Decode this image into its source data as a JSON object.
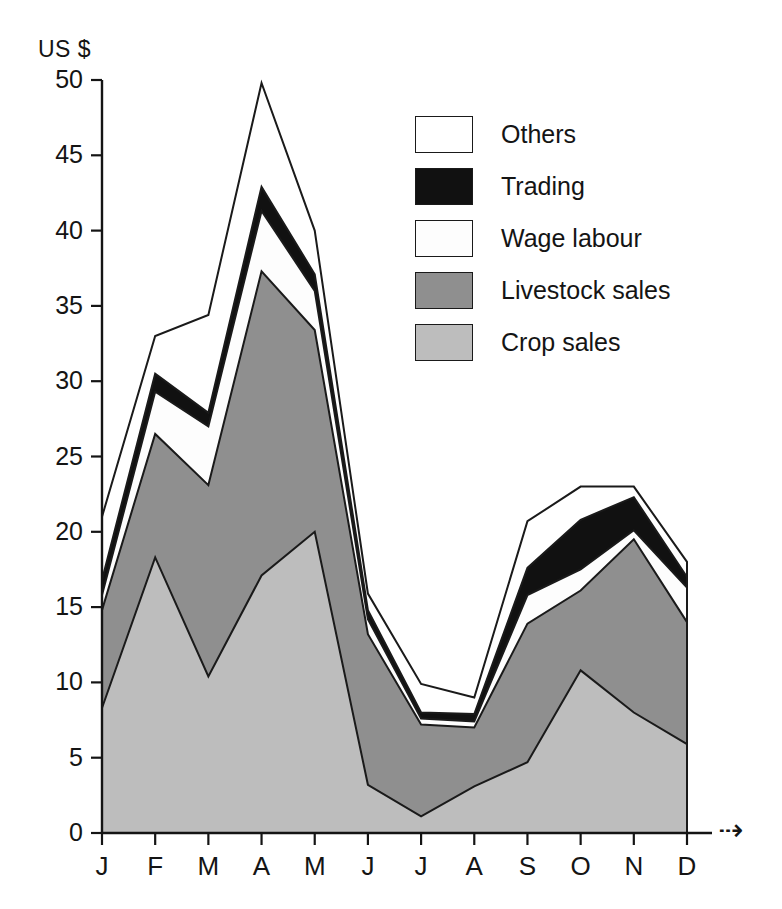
{
  "chart_data": {
    "type": "area",
    "stacked": true,
    "title": "",
    "subtitle": "",
    "xlabel": "",
    "ylabel": "US $",
    "ylim": [
      0,
      50
    ],
    "yticks": [
      0,
      5,
      10,
      15,
      20,
      25,
      30,
      35,
      40,
      45,
      50
    ],
    "grid": false,
    "legend_position": "inside-top-right",
    "categories": [
      "J",
      "F",
      "M",
      "A",
      "M",
      "J",
      "J",
      "A",
      "S",
      "O",
      "N",
      "D"
    ],
    "month_names": [
      "January",
      "February",
      "March",
      "April",
      "May",
      "June",
      "July",
      "August",
      "September",
      "October",
      "November",
      "December"
    ],
    "series": [
      {
        "name": "Crop sales",
        "color": "#bdbdbd",
        "values": [
          8.3,
          18.3,
          10.4,
          17.1,
          20.0,
          3.2,
          1.1,
          3.1,
          4.7,
          10.8,
          8.0,
          5.9
        ]
      },
      {
        "name": "Livestock sales",
        "color": "#8f8f8f",
        "values": [
          6.5,
          8.2,
          12.7,
          20.2,
          13.4,
          10.0,
          6.1,
          3.9,
          9.2,
          5.3,
          11.5,
          8.1
        ]
      },
      {
        "name": "Wage labour",
        "color": "#fdfdfd",
        "values": [
          1.0,
          2.8,
          3.9,
          4.0,
          2.6,
          1.0,
          0.4,
          0.4,
          1.9,
          1.4,
          0.6,
          2.3
        ]
      },
      {
        "name": "Trading",
        "color": "#111111",
        "values": [
          1.0,
          1.2,
          0.9,
          1.6,
          1.1,
          0.6,
          0.4,
          0.5,
          1.8,
          3.3,
          2.2,
          0.7
        ]
      },
      {
        "name": "Others",
        "color": "#ffffff",
        "values": [
          4.2,
          2.5,
          6.5,
          6.9,
          2.9,
          1.1,
          1.9,
          1.1,
          3.1,
          2.2,
          0.7,
          1.0
        ]
      }
    ],
    "stacked_totals": [
      21.0,
      33.0,
      34.4,
      49.8,
      40.0,
      15.9,
      9.9,
      9.0,
      20.7,
      23.0,
      23.0,
      18.0
    ],
    "legend_entries": [
      {
        "label": "Others",
        "color": "#ffffff"
      },
      {
        "label": "Trading",
        "color": "#111111"
      },
      {
        "label": "Wage labour",
        "color": "#fdfdfd"
      },
      {
        "label": "Livestock sales",
        "color": "#8f8f8f"
      },
      {
        "label": "Crop sales",
        "color": "#bdbdbd"
      }
    ],
    "axis_end_marker": "⇢"
  },
  "axis": {
    "y_unit": "US $",
    "y_tick_labels": [
      "50",
      "45",
      "40",
      "35",
      "30",
      "25",
      "20",
      "15",
      "10",
      "5",
      "0"
    ],
    "x_tick_labels": [
      "J",
      "F",
      "M",
      "A",
      "M",
      "J",
      "J",
      "A",
      "S",
      "O",
      "N",
      "D"
    ],
    "end_arrow": "⇢"
  },
  "legend": {
    "items": [
      {
        "label": "Others"
      },
      {
        "label": "Trading"
      },
      {
        "label": "Wage labour"
      },
      {
        "label": "Livestock sales"
      },
      {
        "label": "Crop sales"
      }
    ]
  }
}
